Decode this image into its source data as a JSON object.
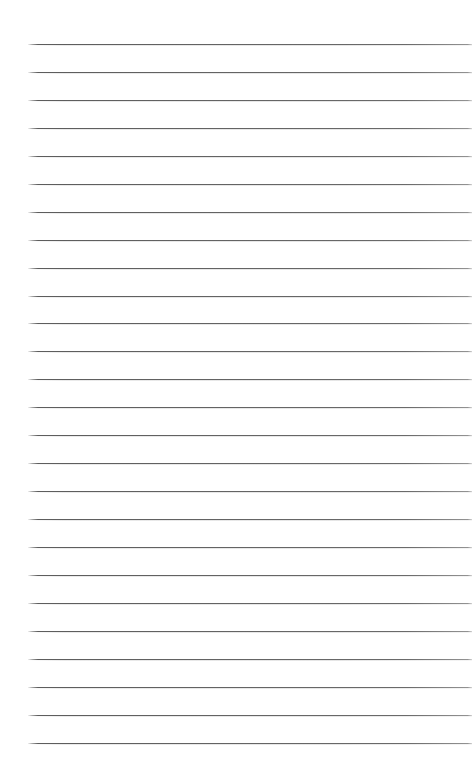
{
  "page": {
    "title": "Lined Paper",
    "kind": "ruled-notebook-page",
    "width": 475,
    "height": 774,
    "background_color": "#ffffff",
    "content_text": ""
  },
  "ruling": {
    "line_color": "#606060",
    "line_thickness_px": 1,
    "line_count": 26,
    "first_line_y": 44,
    "line_spacing_px": 27.95,
    "line_start_x": 28,
    "line_end_x": 472,
    "margin_rule": false,
    "holes": false
  },
  "lines": [
    {
      "index": 1,
      "y": 44,
      "x1": 28,
      "x2": 472
    },
    {
      "index": 2,
      "y": 72,
      "x1": 28,
      "x2": 472
    },
    {
      "index": 3,
      "y": 100,
      "x1": 28,
      "x2": 472
    },
    {
      "index": 4,
      "y": 128,
      "x1": 28,
      "x2": 472
    },
    {
      "index": 5,
      "y": 156,
      "x1": 28,
      "x2": 472
    },
    {
      "index": 6,
      "y": 184,
      "x1": 28,
      "x2": 472
    },
    {
      "index": 7,
      "y": 212,
      "x1": 28,
      "x2": 472
    },
    {
      "index": 8,
      "y": 240,
      "x1": 28,
      "x2": 472
    },
    {
      "index": 9,
      "y": 268,
      "x1": 28,
      "x2": 472
    },
    {
      "index": 10,
      "y": 296,
      "x1": 28,
      "x2": 472
    },
    {
      "index": 11,
      "y": 323,
      "x1": 28,
      "x2": 472
    },
    {
      "index": 12,
      "y": 351,
      "x1": 28,
      "x2": 472
    },
    {
      "index": 13,
      "y": 379,
      "x1": 28,
      "x2": 472
    },
    {
      "index": 14,
      "y": 407,
      "x1": 28,
      "x2": 472
    },
    {
      "index": 15,
      "y": 435,
      "x1": 28,
      "x2": 472
    },
    {
      "index": 16,
      "y": 463,
      "x1": 28,
      "x2": 472
    },
    {
      "index": 17,
      "y": 491,
      "x1": 28,
      "x2": 472
    },
    {
      "index": 18,
      "y": 519,
      "x1": 28,
      "x2": 472
    },
    {
      "index": 19,
      "y": 547,
      "x1": 28,
      "x2": 472
    },
    {
      "index": 20,
      "y": 575,
      "x1": 28,
      "x2": 472
    },
    {
      "index": 21,
      "y": 603,
      "x1": 28,
      "x2": 472
    },
    {
      "index": 22,
      "y": 631,
      "x1": 28,
      "x2": 472
    },
    {
      "index": 23,
      "y": 659,
      "x1": 28,
      "x2": 472
    },
    {
      "index": 24,
      "y": 687,
      "x1": 28,
      "x2": 472
    },
    {
      "index": 25,
      "y": 715,
      "x1": 28,
      "x2": 472
    },
    {
      "index": 26,
      "y": 743,
      "x1": 28,
      "x2": 472
    }
  ]
}
